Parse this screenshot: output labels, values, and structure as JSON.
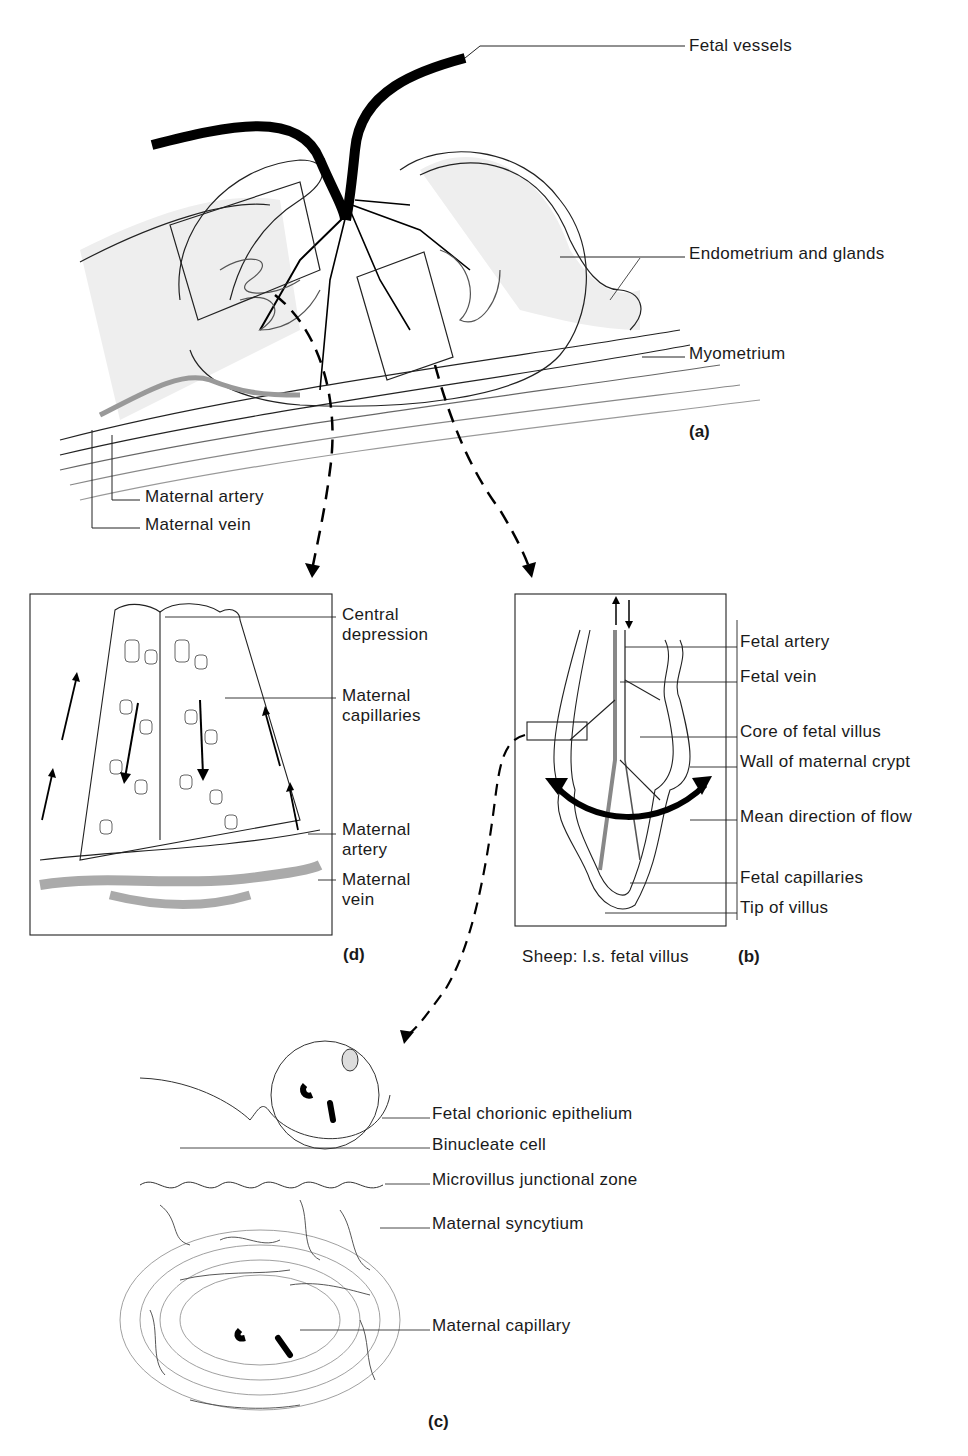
{
  "figure": {
    "panel_a": {
      "tag": "(a)",
      "labels": {
        "fetal_vessels": "Fetal vessels",
        "endometrium": "Endometrium and glands",
        "myometrium": "Myometrium",
        "maternal_artery": "Maternal artery",
        "maternal_vein": "Maternal vein"
      }
    },
    "panel_d": {
      "tag": "(d)",
      "labels": {
        "central_depression": "Central depression",
        "maternal_capillaries": "Maternal capillaries",
        "maternal_artery": "Maternal artery",
        "maternal_vein": "Maternal vein"
      }
    },
    "panel_b": {
      "tag": "(b)",
      "caption": "Sheep: l.s. fetal villus",
      "labels": {
        "fetal_artery": "Fetal artery",
        "fetal_vein": "Fetal vein",
        "core": "Core of fetal villus",
        "wall": "Wall of maternal crypt",
        "flow": "Mean direction of flow",
        "fetal_capillaries": "Fetal capillaries",
        "tip": "Tip of villus"
      }
    },
    "panel_c": {
      "tag": "(c)",
      "labels": {
        "chorionic": "Fetal chorionic epithelium",
        "binucleate": "Binucleate cell",
        "microvillus": "Microvillus junctional zone",
        "syncytium": "Maternal syncytium",
        "capillary": "Maternal capillary"
      }
    }
  }
}
